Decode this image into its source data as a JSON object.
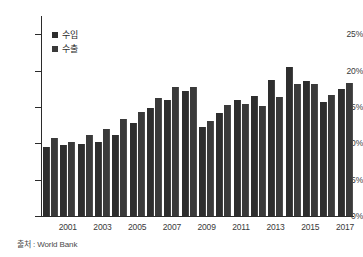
{
  "chart_data": {
    "type": "bar",
    "title": "",
    "xlabel": "",
    "ylabel": "",
    "ylim": [
      0,
      27.5
    ],
    "yticks": [
      0,
      5,
      10,
      15,
      20,
      25
    ],
    "ytick_labels": [
      "0%",
      "5%",
      "10%",
      "15%",
      "20%",
      "25%"
    ],
    "grid": false,
    "legend_position": "top-left",
    "categories": [
      "2000",
      "2001",
      "2002",
      "2003",
      "2004",
      "2005",
      "2006",
      "2007",
      "2008",
      "2009",
      "2010",
      "2011",
      "2012",
      "2013",
      "2014",
      "2015",
      "2016",
      "2017"
    ],
    "tick_labels": [
      "",
      "2001",
      "",
      "2003",
      "",
      "2005",
      "",
      "2007",
      "",
      "2009",
      "",
      "2011",
      "",
      "2013",
      "",
      "2015",
      "",
      "2017"
    ],
    "series": [
      {
        "name": "수입",
        "values": [
          9.5,
          9.8,
          9.9,
          10.2,
          11.2,
          12.8,
          14.8,
          16.0,
          17.2,
          12.3,
          14.1,
          15.9,
          16.5,
          18.7,
          20.5,
          18.5,
          15.7,
          17.4
        ]
      },
      {
        "name": "수출",
        "values": [
          10.7,
          10.2,
          11.2,
          12.0,
          13.3,
          14.3,
          16.2,
          17.8,
          17.8,
          13.1,
          15.3,
          15.4,
          15.1,
          16.4,
          18.1,
          18.2,
          16.7,
          18.3
        ]
      }
    ],
    "colors": {
      "import": "#2e2e2e",
      "export": "#3a3a3a",
      "axis": "#2b2b2b",
      "text": "#3a3a3a"
    }
  },
  "legend": {
    "items": [
      {
        "label": "수입"
      },
      {
        "label": "수출"
      }
    ]
  },
  "source": {
    "text": "출처 : World Bank"
  }
}
